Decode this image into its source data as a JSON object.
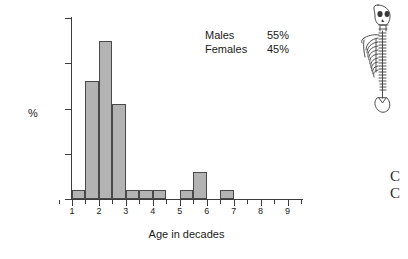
{
  "chart_data": {
    "type": "bar",
    "title": "",
    "xlabel": "Age in decades",
    "ylabel": "%",
    "xlim": [
      0.5,
      9.5
    ],
    "ylim": [
      0,
      40
    ],
    "grid": false,
    "bin_width": 0.5,
    "x_tick_labels": [
      "1",
      "2",
      "3",
      "4",
      "5",
      "6",
      "7",
      "8",
      "9"
    ],
    "x_tick_values": [
      1,
      2,
      3,
      4,
      5,
      6,
      7,
      8,
      9
    ],
    "x_minor_tick_values": [
      0.5,
      1.5,
      2.5,
      3.5,
      4.5,
      5.5,
      6.5,
      7.5,
      8.5,
      9.5
    ],
    "y_tick_labels": [
      "0",
      "10",
      "20",
      "30",
      "40"
    ],
    "y_tick_values": [
      0,
      10,
      20,
      30,
      40
    ],
    "bins": [
      {
        "start": 1.0,
        "end": 1.5,
        "value": 2
      },
      {
        "start": 1.5,
        "end": 2.0,
        "value": 26
      },
      {
        "start": 2.0,
        "end": 2.5,
        "value": 35
      },
      {
        "start": 2.5,
        "end": 3.0,
        "value": 21
      },
      {
        "start": 3.0,
        "end": 3.5,
        "value": 2
      },
      {
        "start": 3.5,
        "end": 4.0,
        "value": 2
      },
      {
        "start": 4.0,
        "end": 4.5,
        "value": 2
      },
      {
        "start": 5.0,
        "end": 5.5,
        "value": 2
      },
      {
        "start": 5.5,
        "end": 6.0,
        "value": 6
      },
      {
        "start": 6.5,
        "end": 7.0,
        "value": 2
      }
    ],
    "categories": [
      "1.0-1.5",
      "1.5-2.0",
      "2.0-2.5",
      "2.5-3.0",
      "3.0-3.5",
      "3.5-4.0",
      "4.0-4.5",
      "5.0-5.5",
      "5.5-6.0",
      "6.5-7.0"
    ],
    "values": [
      2,
      26,
      35,
      21,
      2,
      2,
      2,
      2,
      6,
      2
    ],
    "bar_fill_color": "#b3b3b3",
    "bar_edge_color": "#4a4a4a",
    "axis_color": "#3c3c3c",
    "annotations": [
      {
        "label": "Males",
        "value": "55%"
      },
      {
        "label": "Females",
        "value": "45%"
      }
    ]
  },
  "legend": {
    "rows": [
      {
        "key": "Males",
        "value": "55%"
      },
      {
        "key": "Females",
        "value": "45%"
      }
    ]
  },
  "illustration": {
    "name": "skeleton-figure"
  },
  "margin": {
    "clipped_glyphs": "C\nC"
  }
}
